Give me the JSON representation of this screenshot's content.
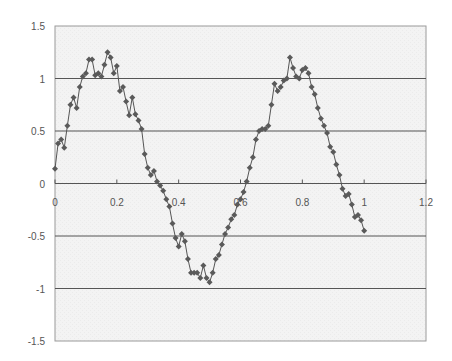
{
  "chart_data": {
    "type": "line",
    "title": "",
    "xlabel": "",
    "ylabel": "",
    "xlim": [
      0,
      1.2
    ],
    "ylim": [
      -1.5,
      1.5
    ],
    "x_ticks": [
      0,
      0.2,
      0.4,
      0.6,
      0.8,
      1,
      1.2
    ],
    "x_tick_labels": [
      "0",
      "0.2",
      "0.4",
      "0.6",
      "0.8",
      "1",
      "1.2"
    ],
    "y_ticks": [
      1.5,
      1,
      0.5,
      0,
      -0.5,
      -1,
      -1.5
    ],
    "y_tick_labels": [
      "1.5",
      "1",
      "0.5",
      "0",
      "-0.5",
      "-1",
      "-1.5"
    ],
    "grid": "horizontal major gridlines",
    "legend": "none",
    "marker": "diamond",
    "series": [
      {
        "name": "Series1",
        "color": "#555555",
        "x": [
          0.0,
          0.01,
          0.02,
          0.03,
          0.04,
          0.05,
          0.06,
          0.07,
          0.08,
          0.09,
          0.1,
          0.11,
          0.12,
          0.13,
          0.14,
          0.15,
          0.16,
          0.17,
          0.18,
          0.19,
          0.2,
          0.21,
          0.22,
          0.23,
          0.24,
          0.25,
          0.26,
          0.27,
          0.28,
          0.29,
          0.3,
          0.31,
          0.32,
          0.33,
          0.34,
          0.35,
          0.36,
          0.37,
          0.38,
          0.39,
          0.4,
          0.41,
          0.42,
          0.43,
          0.44,
          0.45,
          0.46,
          0.47,
          0.48,
          0.49,
          0.5,
          0.51,
          0.52,
          0.53,
          0.54,
          0.55,
          0.56,
          0.57,
          0.58,
          0.59,
          0.6,
          0.61,
          0.62,
          0.63,
          0.64,
          0.65,
          0.66,
          0.67,
          0.68,
          0.69,
          0.7,
          0.71,
          0.72,
          0.73,
          0.74,
          0.75,
          0.76,
          0.77,
          0.78,
          0.79,
          0.8,
          0.81,
          0.82,
          0.83,
          0.84,
          0.85,
          0.86,
          0.87,
          0.88,
          0.89,
          0.9,
          0.91,
          0.92,
          0.93,
          0.94,
          0.95,
          0.96,
          0.97,
          0.98,
          0.99,
          1.0
        ],
        "y": [
          0.14,
          0.38,
          0.42,
          0.34,
          0.55,
          0.75,
          0.82,
          0.72,
          0.92,
          1.02,
          1.05,
          1.18,
          1.18,
          1.03,
          1.05,
          1.02,
          1.13,
          1.25,
          1.2,
          1.05,
          1.12,
          0.88,
          0.92,
          0.78,
          0.65,
          0.82,
          0.66,
          0.6,
          0.52,
          0.28,
          0.15,
          0.08,
          0.12,
          0.02,
          -0.02,
          -0.07,
          -0.15,
          -0.22,
          -0.38,
          -0.52,
          -0.6,
          -0.48,
          -0.55,
          -0.72,
          -0.85,
          -0.85,
          -0.85,
          -0.9,
          -0.78,
          -0.9,
          -0.94,
          -0.85,
          -0.72,
          -0.68,
          -0.58,
          -0.48,
          -0.42,
          -0.34,
          -0.3,
          -0.2,
          -0.15,
          -0.08,
          0.02,
          0.15,
          0.25,
          0.42,
          0.5,
          0.52,
          0.52,
          0.55,
          0.75,
          0.95,
          0.88,
          0.92,
          0.98,
          1.0,
          1.2,
          1.1,
          1.02,
          1.0,
          1.08,
          1.1,
          1.05,
          0.92,
          0.85,
          0.72,
          0.62,
          0.55,
          0.48,
          0.35,
          0.3,
          0.18,
          0.08,
          -0.05,
          -0.12,
          -0.1,
          -0.2,
          -0.32,
          -0.3,
          -0.35,
          -0.45
        ]
      }
    ]
  }
}
